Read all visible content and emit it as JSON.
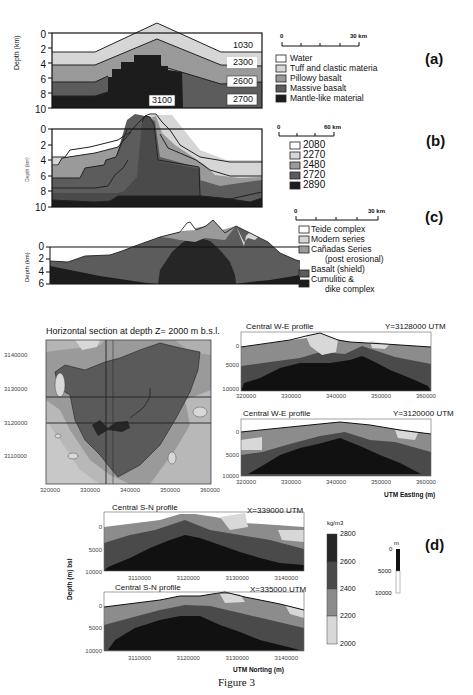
{
  "figure": {
    "caption": "Figure 3",
    "panels": {
      "a": {
        "label": "(a)",
        "ylabel": "Depth (km)",
        "yticks": [
          "0",
          "2",
          "4",
          "6",
          "8",
          "10"
        ],
        "scale_bar": {
          "start": "0",
          "end": "30 km"
        },
        "density_labels": [
          "1030",
          "2300",
          "2600",
          "2700",
          "3100"
        ],
        "legend": [
          {
            "label": "Water",
            "color": "#ffffff"
          },
          {
            "label": "Tuff and clastic materia",
            "color": "#d6d6d6"
          },
          {
            "label": "Pillowy basalt",
            "color": "#9a9a9a"
          },
          {
            "label": "Massive basalt",
            "color": "#5c5c5c"
          },
          {
            "label": "Mantle-like material",
            "color": "#1c1c1c"
          }
        ]
      },
      "b": {
        "label": "(b)",
        "ylabel": "Depth (km)",
        "yticks": [
          "0",
          "2",
          "4",
          "6",
          "8",
          "10"
        ],
        "scale_bar": {
          "start": "0",
          "end": "60 km"
        },
        "legend": [
          {
            "label": "2080",
            "color": "#ffffff"
          },
          {
            "label": "2270",
            "color": "#d6d6d6"
          },
          {
            "label": "2480",
            "color": "#9a9a9a"
          },
          {
            "label": "2720",
            "color": "#5c5c5c"
          },
          {
            "label": "2890",
            "color": "#1c1c1c"
          }
        ]
      },
      "c": {
        "label": "(c)",
        "ylabel": "Depth (km)",
        "yticks": [
          "0",
          "2",
          "4",
          "6"
        ],
        "scale_bar": {
          "start": "0",
          "end": "30 km"
        },
        "legend": [
          {
            "label": "Teide complex",
            "color": "#ffffff"
          },
          {
            "label": "Modern series",
            "color": "#d6d6d6"
          },
          {
            "label": "Cañadas Series",
            "sub": "(post erosional)",
            "color": "#9a9a9a"
          },
          {
            "label": "Basalt (shield)",
            "color": "#5c5c5c"
          },
          {
            "label": "Cumulitic &",
            "sub": "dike complex",
            "color": "#1c1c1c"
          }
        ]
      },
      "d": {
        "label": "(d)",
        "horizontal_section": {
          "title": "Horizontal section at depth Z= 2000 m b.s.l.",
          "xticks": [
            "320000",
            "330000",
            "340000",
            "350000",
            "360000"
          ],
          "yticks": [
            "3140000",
            "3130000",
            "3120000",
            "3110000"
          ]
        },
        "we_profiles": [
          {
            "title": "Central W-E profile",
            "coord": "Y=3128000 UTM",
            "yticks": [
              "0",
              "5000",
              "10000"
            ],
            "xticks": [
              "320000",
              "330000",
              "340000",
              "350000",
              "360000"
            ]
          },
          {
            "title": "Central W-E profile",
            "coord": "Y=3120000 UTM",
            "yticks": [
              "0",
              "5000",
              "10000"
            ],
            "xticks": [
              "320000",
              "330000",
              "340000",
              "350000",
              "360000"
            ]
          }
        ],
        "we_xlabel": "UTM Easting (m)",
        "sn_profiles": [
          {
            "title": "Central S-N profile",
            "coord": "X=339000 UTM",
            "yticks": [
              "0",
              "5000",
              "10000"
            ],
            "xticks": [
              "3110000",
              "3120000",
              "3130000",
              "3140000"
            ]
          },
          {
            "title": "Central S-N profile",
            "coord": "X=335000 UTM",
            "yticks": [
              "0",
              "5000",
              "10000"
            ],
            "xticks": [
              "3110000",
              "3120000",
              "3130000",
              "3140000"
            ]
          }
        ],
        "sn_ylabel": "Depth (m) bsl",
        "sn_xlabel": "UTM Norting (m)",
        "colorbar": {
          "unit": "kg/m3",
          "ticks": [
            "2800",
            "2600",
            "2400",
            "2200",
            "2000"
          ],
          "colors": [
            "#262626",
            "#4a4a4a",
            "#8c8c8c",
            "#d8d8d8"
          ]
        },
        "vertical_scale": {
          "unit": "m",
          "ticks": [
            "0",
            "5000",
            "10000"
          ]
        }
      }
    }
  }
}
